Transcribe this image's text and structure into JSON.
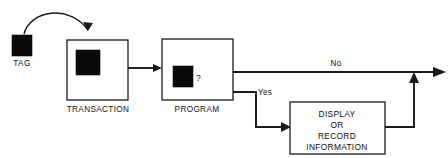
{
  "diagram": {
    "background_color": "#ffffff",
    "line_color": "#1a1a1a",
    "chip_color": "#0a0a0a",
    "nodes": [
      {
        "id": "tag",
        "caption": "TAG",
        "kind": "chip-only",
        "x": 12,
        "y": 35,
        "w": 20,
        "h": 21,
        "caption_x": 22,
        "caption_y": 66
      },
      {
        "id": "transaction",
        "caption": "TRANSACTION",
        "kind": "box-with-chip",
        "x": 67,
        "y": 40,
        "w": 61,
        "h": 60,
        "chip_x": 76,
        "chip_y": 50,
        "chip_w": 24,
        "chip_h": 25,
        "caption_x": 98,
        "caption_y": 112
      },
      {
        "id": "program",
        "caption": "PROGRAM",
        "kind": "box-with-chip-and-question",
        "x": 162,
        "y": 39,
        "w": 71,
        "h": 61,
        "chip_x": 173,
        "chip_y": 66,
        "chip_w": 20,
        "chip_h": 21,
        "question": "?",
        "question_x": 197,
        "question_y": 80,
        "caption_x": 197,
        "caption_y": 112
      },
      {
        "id": "display",
        "caption": "",
        "kind": "box-with-text",
        "x": 290,
        "y": 102,
        "w": 95,
        "h": 52,
        "lines": [
          "DISPLAY",
          "OR",
          "RECORD",
          "INFORMATION"
        ],
        "text_x": 337,
        "line_ys": [
          116,
          127,
          138,
          149
        ]
      }
    ],
    "edges": [
      {
        "id": "tag-to-transaction",
        "kind": "curve",
        "label": "",
        "path": "M 24 34 C 30 10 70 4 88 30"
      },
      {
        "id": "transaction-to-program",
        "kind": "straight",
        "label": "",
        "path": "M 128 68 L 157 68"
      },
      {
        "id": "program-no",
        "kind": "straight",
        "label": "No",
        "label_x": 336,
        "label_y": 66,
        "path": "M 233 72 L 436 72"
      },
      {
        "id": "program-yes",
        "kind": "elbow",
        "label": "Yes",
        "label_x": 265,
        "label_y": 95,
        "path": "M 233 92 L 256 92 L 256 127 L 285 127"
      },
      {
        "id": "display-return",
        "kind": "elbow",
        "label": "",
        "path": "M 385 127 L 414 127 L 414 78"
      }
    ]
  }
}
